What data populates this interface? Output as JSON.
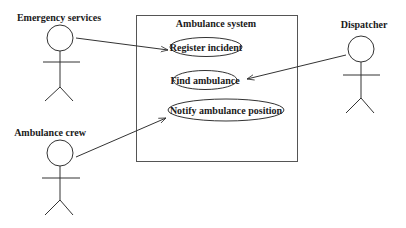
{
  "diagram": {
    "type": "UML use case diagram",
    "system": {
      "title": "Ambulance system"
    },
    "actors": [
      {
        "id": "emergency-services",
        "label": "Emergency services"
      },
      {
        "id": "dispatcher",
        "label": "Dispatcher"
      },
      {
        "id": "ambulance-crew",
        "label": "Ambulance crew"
      }
    ],
    "use_cases": [
      {
        "id": "register-incident",
        "label": "Register incident"
      },
      {
        "id": "find-ambulance",
        "label": "Find ambulance"
      },
      {
        "id": "notify-ambulance-position",
        "label": "Notify ambulance position"
      }
    ],
    "associations": [
      {
        "from": "Emergency services",
        "to": "Register incident"
      },
      {
        "from": "Dispatcher",
        "to": "Find ambulance"
      },
      {
        "from": "Ambulance crew",
        "to": "Notify ambulance position"
      }
    ],
    "colors": {
      "line": "#333333",
      "box": "#555555",
      "text": "#1a1a1a",
      "background": "#ffffff"
    }
  }
}
